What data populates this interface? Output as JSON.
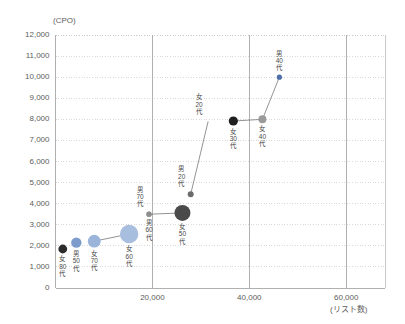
{
  "chart_data": {
    "type": "scatter",
    "title": "",
    "ylabel": "(CPO)",
    "xlabel": "(リスト数)",
    "xlim": [
      0,
      68000
    ],
    "ylim": [
      0,
      12000
    ],
    "grid": true,
    "legend": "none",
    "y_ticks": [
      "0",
      "1,000",
      "2,000",
      "3,000",
      "4,000",
      "5,000",
      "6,000",
      "7,000",
      "8,000",
      "9,000",
      "10,000",
      "11,000",
      "12,000"
    ],
    "y_tick_values": [
      0,
      1000,
      2000,
      3000,
      4000,
      5000,
      6000,
      7000,
      8000,
      9000,
      10000,
      11000,
      12000
    ],
    "x_ticks": [
      "20,000",
      "40,000",
      "60,000"
    ],
    "x_tick_values": [
      20000,
      40000,
      60000
    ],
    "points": [
      {
        "label": "女80代",
        "label_lines": [
          "女",
          "80",
          "代"
        ],
        "x": 1500,
        "y": 1850,
        "size": 4.4,
        "color": "#2b2b2b",
        "label_pos": "below"
      },
      {
        "label": "男50代",
        "label_lines": [
          "男",
          "50",
          "代"
        ],
        "x": 4300,
        "y": 2150,
        "size": 5.2,
        "color": "#7e9ccb",
        "label_pos": "below"
      },
      {
        "label": "女70代",
        "label_lines": [
          "女",
          "70",
          "代"
        ],
        "x": 8000,
        "y": 2220,
        "size": 6.4,
        "color": "#9ab4da",
        "label_pos": "below"
      },
      {
        "label": "女60代",
        "label_lines": [
          "女",
          "60",
          "代"
        ],
        "x": 15200,
        "y": 2560,
        "size": 9.2,
        "color": "#a8bede",
        "label_pos": "below"
      },
      {
        "label": "男70代",
        "label_lines": [
          "男",
          "70",
          "代"
        ],
        "x": 19300,
        "y": 3500,
        "size": 2.6,
        "color": "#8e8e8e",
        "label_pos": "upper-left"
      },
      {
        "label": "男60代",
        "label_lines": [
          "男",
          "60",
          "代"
        ],
        "x": 19300,
        "y": 3500,
        "size": 2.6,
        "color": "#8e8e8e",
        "label_pos": "below"
      },
      {
        "label": "女50代",
        "label_lines": [
          "女",
          "50",
          "代"
        ],
        "x": 26200,
        "y": 3560,
        "size": 8.0,
        "color": "#4a4a4a",
        "label_pos": "below"
      },
      {
        "label": "男20代",
        "label_lines": [
          "男",
          "20",
          "代"
        ],
        "x": 27900,
        "y": 4450,
        "size": 3.0,
        "color": "#6b6b6b",
        "label_pos": "upper-left"
      },
      {
        "label": "女20代",
        "label_lines": [
          "女",
          "20",
          "代"
        ],
        "x": 31500,
        "y": 7900,
        "size": 0,
        "color": "#cfcfcf",
        "label_pos": "upper-left"
      },
      {
        "label": "女30代",
        "label_lines": [
          "女",
          "30",
          "代"
        ],
        "x": 36700,
        "y": 7920,
        "size": 4.6,
        "color": "#1f1f1f",
        "label_pos": "below"
      },
      {
        "label": "女40代",
        "label_lines": [
          "女",
          "40",
          "代"
        ],
        "x": 42700,
        "y": 8000,
        "size": 4.0,
        "color": "#9a9a9a",
        "label_pos": "below"
      },
      {
        "label": "男40代",
        "label_lines": [
          "男",
          "40",
          "代"
        ],
        "x": 46200,
        "y": 10000,
        "size": 2.6,
        "color": "#4d6fa8",
        "label_pos": "above"
      }
    ],
    "connectors": [
      {
        "from": "男60代",
        "to": "女50代"
      },
      {
        "from": "女30代",
        "to": "女40代"
      },
      {
        "from": "女40代",
        "to": "男40代"
      },
      {
        "from": "男20代",
        "to": "女20代"
      },
      {
        "from": "女60代",
        "to": "女70代"
      }
    ],
    "colors": {
      "bubble_blue": "#a8bede",
      "bubble_dark": "#4a4a4a",
      "bubble_gray": "#9a9a9a",
      "accent_blue": "#4d6fa8",
      "axis": "#b8b8b8",
      "gridline": "#d9d9d9",
      "text": "#5d5d5d"
    }
  }
}
